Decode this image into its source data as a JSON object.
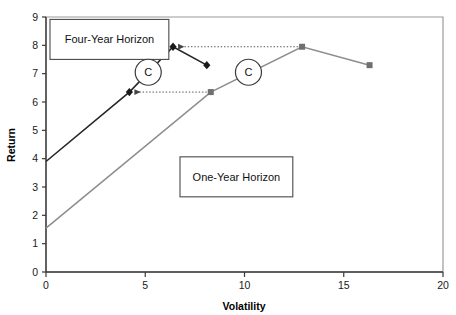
{
  "chart_data": {
    "type": "line",
    "title": "",
    "xlabel": "Volatility",
    "ylabel": "Return",
    "xlim": [
      0,
      20
    ],
    "ylim": [
      0,
      9
    ],
    "xticks": [
      0,
      5,
      10,
      15,
      20
    ],
    "yticks": [
      0,
      1,
      2,
      3,
      4,
      5,
      6,
      7,
      8,
      9
    ],
    "xtick_labels": [
      "0",
      "5",
      "10",
      "15",
      "20"
    ],
    "ytick_labels": [
      "0",
      "1",
      "2",
      "3",
      "4",
      "5",
      "6",
      "7",
      "8",
      "9"
    ],
    "grid": false,
    "legend": "none",
    "series": [
      {
        "name": "Four-Year Horizon",
        "color": "#262626",
        "marker": "diamond",
        "points": [
          {
            "x": 0.0,
            "y": 3.9
          },
          {
            "x": 4.2,
            "y": 6.35
          },
          {
            "x": 6.4,
            "y": 7.95
          },
          {
            "x": 8.1,
            "y": 7.3
          }
        ]
      },
      {
        "name": "One-Year Horizon",
        "color": "#8d8d8d",
        "marker": "square",
        "points": [
          {
            "x": 0.0,
            "y": 1.55
          },
          {
            "x": 8.3,
            "y": 6.35
          },
          {
            "x": 12.9,
            "y": 7.95
          },
          {
            "x": 16.3,
            "y": 7.3
          }
        ]
      }
    ],
    "annotations": [
      {
        "label": "Four-Year Horizon",
        "kind": "box",
        "x": 0.1,
        "y": 8.95
      },
      {
        "label": "One-Year Horizon",
        "kind": "box",
        "x": 6.65,
        "y": 4.1
      },
      {
        "label": "C",
        "kind": "circle-marker",
        "x": 5.15,
        "y": 7.05
      },
      {
        "label": "C",
        "kind": "circle-marker",
        "x": 10.2,
        "y": 7.05
      }
    ],
    "connectors": [
      {
        "from": {
          "x": 12.9,
          "y": 7.95
        },
        "to": {
          "x": 6.4,
          "y": 7.95
        },
        "style": "dotted-arrow"
      },
      {
        "from": {
          "x": 8.3,
          "y": 6.35
        },
        "to": {
          "x": 4.2,
          "y": 6.35
        },
        "style": "dotted-arrow"
      }
    ],
    "colors": {
      "four_year": "#262626",
      "one_year": "#8d8d8d",
      "axis": "#3a3a3a",
      "border": "#9a9a9a",
      "background": "#ffffff"
    }
  }
}
